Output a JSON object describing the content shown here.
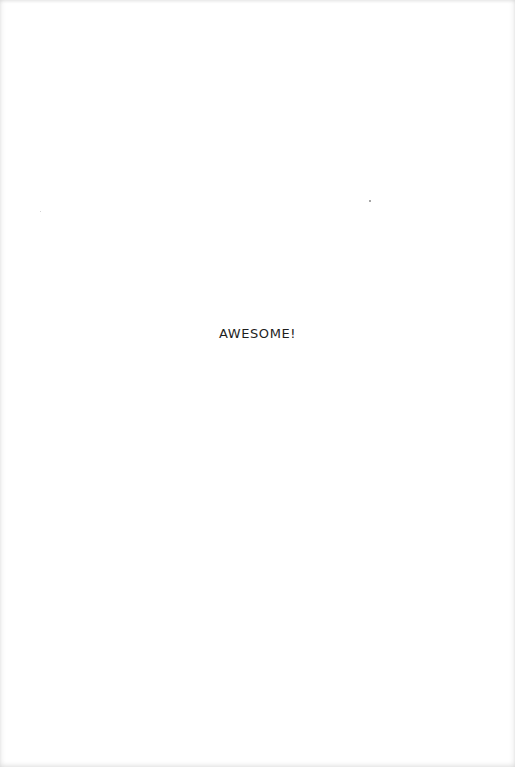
{
  "page": {
    "headline": "AWESOME!"
  }
}
